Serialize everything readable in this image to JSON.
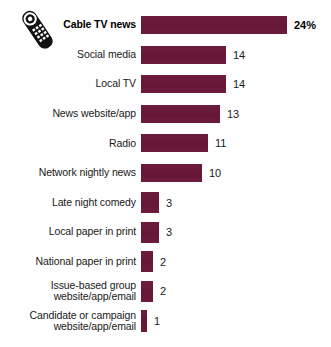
{
  "icon": {
    "name": "tv-remote-icon",
    "description": "television remote control"
  },
  "chart_data": {
    "type": "bar",
    "orientation": "horizontal",
    "title": "",
    "subtitle": "",
    "xlabel": "",
    "ylabel": "",
    "xlim": [
      0,
      24
    ],
    "grid": false,
    "legend": null,
    "value_suffix_first": "%",
    "bar_color": "#6b1a3c",
    "background_color": "#ffffff",
    "categories": [
      "Cable TV news",
      "Social media",
      "Local TV",
      "News website/app",
      "Radio",
      "Network nightly news",
      "Late night comedy",
      "Local paper in print",
      "National paper in print",
      "Issue-based group\nwebsite/app/email",
      "Candidate or campaign\nwebsite/app/email"
    ],
    "values": [
      24,
      14,
      14,
      13,
      11,
      10,
      3,
      3,
      2,
      2,
      1
    ],
    "value_labels": [
      "24%",
      "14",
      "14",
      "13",
      "11",
      "10",
      "3",
      "3",
      "2",
      "2",
      "1"
    ],
    "emphasis_index": 0
  }
}
